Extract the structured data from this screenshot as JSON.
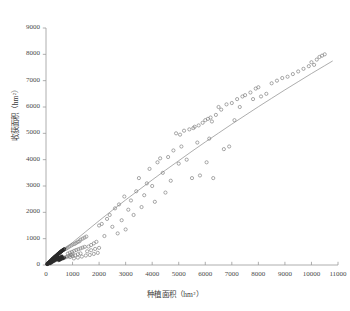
{
  "chart_data": {
    "type": "scatter",
    "title": "",
    "xlabel": "种植面积（hm²）",
    "ylabel": "收获面积（hm²）",
    "xlim": [
      0,
      11000
    ],
    "ylim": [
      0,
      9000
    ],
    "xticks": [
      0,
      1000,
      2000,
      3000,
      4000,
      5000,
      6000,
      7000,
      8000,
      9000,
      10000,
      11000
    ],
    "yticks": [
      0,
      1000,
      2000,
      3000,
      4000,
      5000,
      6000,
      7000,
      8000,
      9000
    ],
    "xtick_labels": [
      "0",
      "1000",
      "2000",
      "3000",
      "4000",
      "5000",
      "6000",
      "7000",
      "8000",
      "9000",
      "10000",
      "11000"
    ],
    "ytick_labels": [
      "0",
      "1000",
      "2000",
      "3000",
      "4000",
      "5000",
      "6000",
      "7000",
      "8000",
      "9000"
    ],
    "grid": false,
    "legend": null,
    "marker": "open-circle",
    "marker_color": "#7a7a7a",
    "marker_size": 3.2,
    "line_color": "#8a8a8a",
    "series": [
      {
        "name": "观测点",
        "type": "scatter",
        "points": [
          [
            40,
            30
          ],
          [
            55,
            45
          ],
          [
            70,
            60
          ],
          [
            85,
            70
          ],
          [
            95,
            85
          ],
          [
            110,
            95
          ],
          [
            120,
            105
          ],
          [
            135,
            120
          ],
          [
            145,
            130
          ],
          [
            160,
            140
          ],
          [
            170,
            155
          ],
          [
            185,
            165
          ],
          [
            195,
            175
          ],
          [
            205,
            190
          ],
          [
            215,
            200
          ],
          [
            230,
            210
          ],
          [
            240,
            225
          ],
          [
            250,
            235
          ],
          [
            265,
            245
          ],
          [
            275,
            255
          ],
          [
            285,
            265
          ],
          [
            300,
            275
          ],
          [
            310,
            290
          ],
          [
            320,
            300
          ],
          [
            335,
            310
          ],
          [
            345,
            320
          ],
          [
            355,
            330
          ],
          [
            370,
            340
          ],
          [
            380,
            350
          ],
          [
            390,
            360
          ],
          [
            405,
            370
          ],
          [
            415,
            380
          ],
          [
            425,
            395
          ],
          [
            440,
            400
          ],
          [
            450,
            415
          ],
          [
            460,
            425
          ],
          [
            475,
            430
          ],
          [
            485,
            445
          ],
          [
            495,
            455
          ],
          [
            510,
            460
          ],
          [
            520,
            475
          ],
          [
            530,
            485
          ],
          [
            545,
            490
          ],
          [
            555,
            505
          ],
          [
            565,
            510
          ],
          [
            580,
            520
          ],
          [
            590,
            530
          ],
          [
            600,
            540
          ],
          [
            615,
            545
          ],
          [
            625,
            560
          ],
          [
            640,
            565
          ],
          [
            650,
            575
          ],
          [
            665,
            580
          ],
          [
            675,
            590
          ],
          [
            690,
            600
          ],
          [
            700,
            605
          ],
          [
            60,
            35
          ],
          [
            90,
            55
          ],
          [
            130,
            80
          ],
          [
            175,
            110
          ],
          [
            220,
            150
          ],
          [
            260,
            180
          ],
          [
            305,
            215
          ],
          [
            350,
            250
          ],
          [
            395,
            285
          ],
          [
            440,
            320
          ],
          [
            150,
            60
          ],
          [
            200,
            90
          ],
          [
            250,
            120
          ],
          [
            300,
            150
          ],
          [
            350,
            180
          ],
          [
            400,
            210
          ],
          [
            450,
            240
          ],
          [
            500,
            270
          ],
          [
            550,
            300
          ],
          [
            600,
            330
          ],
          [
            480,
            180
          ],
          [
            530,
            200
          ],
          [
            580,
            230
          ],
          [
            640,
            250
          ],
          [
            700,
            280
          ],
          [
            760,
            300
          ],
          [
            820,
            330
          ],
          [
            880,
            350
          ],
          [
            940,
            380
          ],
          [
            1000,
            400
          ],
          [
            760,
            620
          ],
          [
            820,
            660
          ],
          [
            880,
            700
          ],
          [
            950,
            740
          ],
          [
            1010,
            780
          ],
          [
            1080,
            800
          ],
          [
            1140,
            840
          ],
          [
            1200,
            880
          ],
          [
            1260,
            900
          ],
          [
            820,
            430
          ],
          [
            900,
            470
          ],
          [
            980,
            500
          ],
          [
            1060,
            540
          ],
          [
            1140,
            570
          ],
          [
            1220,
            600
          ],
          [
            1300,
            630
          ],
          [
            1380,
            660
          ],
          [
            1460,
            690
          ],
          [
            900,
            300
          ],
          [
            1000,
            340
          ],
          [
            1100,
            370
          ],
          [
            1200,
            410
          ],
          [
            1300,
            440
          ],
          [
            1050,
            250
          ],
          [
            1200,
            280
          ],
          [
            1350,
            320
          ],
          [
            1500,
            360
          ],
          [
            1300,
            960
          ],
          [
            1380,
            1000
          ],
          [
            1450,
            1040
          ],
          [
            1520,
            1080
          ],
          [
            1600,
            700
          ],
          [
            1700,
            760
          ],
          [
            1800,
            820
          ],
          [
            1900,
            880
          ],
          [
            1550,
            520
          ],
          [
            1700,
            560
          ],
          [
            1850,
            610
          ],
          [
            2000,
            650
          ],
          [
            1650,
            380
          ],
          [
            1800,
            420
          ],
          [
            1950,
            460
          ],
          [
            2000,
            1500
          ],
          [
            2100,
            1560
          ],
          [
            2200,
            1100
          ],
          [
            2300,
            1750
          ],
          [
            2400,
            1900
          ],
          [
            2500,
            1450
          ],
          [
            2600,
            2150
          ],
          [
            2700,
            1200
          ],
          [
            2750,
            2300
          ],
          [
            2850,
            1700
          ],
          [
            2950,
            2600
          ],
          [
            3000,
            1350
          ],
          [
            3100,
            2100
          ],
          [
            3200,
            2450
          ],
          [
            3300,
            1900
          ],
          [
            3400,
            2800
          ],
          [
            3500,
            3300
          ],
          [
            3600,
            2200
          ],
          [
            3700,
            2650
          ],
          [
            3800,
            3100
          ],
          [
            3900,
            3650
          ],
          [
            4000,
            3000
          ],
          [
            4100,
            2400
          ],
          [
            4200,
            3900
          ],
          [
            4300,
            4050
          ],
          [
            4400,
            3500
          ],
          [
            4500,
            2750
          ],
          [
            4600,
            4100
          ],
          [
            4700,
            3200
          ],
          [
            4800,
            4350
          ],
          [
            4900,
            5000
          ],
          [
            5000,
            3850
          ],
          [
            5050,
            4950
          ],
          [
            5100,
            4500
          ],
          [
            5200,
            5100
          ],
          [
            5300,
            4000
          ],
          [
            5400,
            5150
          ],
          [
            5500,
            3300
          ],
          [
            5550,
            5200
          ],
          [
            5600,
            5250
          ],
          [
            5700,
            4650
          ],
          [
            5750,
            5300
          ],
          [
            5800,
            3400
          ],
          [
            5900,
            5400
          ],
          [
            6000,
            5500
          ],
          [
            6050,
            3900
          ],
          [
            6100,
            5550
          ],
          [
            6150,
            4800
          ],
          [
            6200,
            5600
          ],
          [
            6250,
            5450
          ],
          [
            6300,
            3300
          ],
          [
            6400,
            5700
          ],
          [
            6500,
            6000
          ],
          [
            6600,
            5900
          ],
          [
            6700,
            4400
          ],
          [
            6800,
            6100
          ],
          [
            6900,
            4500
          ],
          [
            7000,
            6150
          ],
          [
            7100,
            5500
          ],
          [
            7200,
            6300
          ],
          [
            7300,
            6000
          ],
          [
            7400,
            6400
          ],
          [
            7500,
            6450
          ],
          [
            7700,
            6550
          ],
          [
            7800,
            6300
          ],
          [
            7900,
            6700
          ],
          [
            8000,
            6750
          ],
          [
            8100,
            6400
          ],
          [
            8300,
            6500
          ],
          [
            8500,
            6900
          ],
          [
            8700,
            7000
          ],
          [
            8900,
            7100
          ],
          [
            9100,
            7150
          ],
          [
            9300,
            7250
          ],
          [
            9500,
            7350
          ],
          [
            9700,
            7450
          ],
          [
            9900,
            7550
          ],
          [
            10000,
            7700
          ],
          [
            10100,
            7600
          ],
          [
            10200,
            7800
          ],
          [
            10300,
            7900
          ],
          [
            10400,
            7950
          ],
          [
            10500,
            8000
          ]
        ]
      },
      {
        "name": "拟合曲线",
        "type": "line",
        "points": [
          [
            0,
            0
          ],
          [
            500,
            430
          ],
          [
            1000,
            855
          ],
          [
            1500,
            1270
          ],
          [
            2000,
            1680
          ],
          [
            2500,
            2080
          ],
          [
            3000,
            2470
          ],
          [
            3500,
            2850
          ],
          [
            4000,
            3230
          ],
          [
            4500,
            3600
          ],
          [
            5000,
            3960
          ],
          [
            5500,
            4320
          ],
          [
            6000,
            4670
          ],
          [
            6500,
            5010
          ],
          [
            7000,
            5350
          ],
          [
            7500,
            5680
          ],
          [
            8000,
            6010
          ],
          [
            8500,
            6330
          ],
          [
            9000,
            6650
          ],
          [
            9500,
            6960
          ],
          [
            10000,
            7270
          ],
          [
            10500,
            7570
          ],
          [
            10800,
            7750
          ]
        ]
      }
    ],
    "dense_cluster_note": "密集黑色点簇位于原点附近"
  }
}
